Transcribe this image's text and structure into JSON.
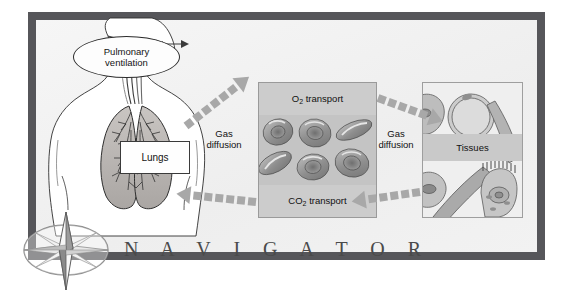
{
  "figure": {
    "title_word": "N A V I G A T O R",
    "frame_color": "#56565a",
    "background_color": "#f3f3f3"
  },
  "nodes": {
    "pulmonary_ventilation": "Pulmonary\nventilation",
    "pulmonary_ventilation_line1": "Pulmonary",
    "pulmonary_ventilation_line2": "ventilation",
    "lungs": "Lungs",
    "o2_transport_pre": "O",
    "o2_transport_sub": "2",
    "o2_transport_post": " transport",
    "co2_transport_pre": "CO",
    "co2_transport_sub": "2",
    "co2_transport_post": " transport",
    "tissues": "Tissues"
  },
  "labels": {
    "gas_diffusion_left_line1": "Gas",
    "gas_diffusion_left_line2": "diffusion",
    "gas_diffusion_right_line1": "Gas",
    "gas_diffusion_right_line2": "diffusion"
  },
  "arrows": [
    {
      "name": "lungs-to-blood-o2",
      "direction": "right",
      "style": "dashed-block"
    },
    {
      "name": "blood-to-lungs-co2",
      "direction": "left",
      "style": "dashed-block"
    },
    {
      "name": "blood-to-tissues-o2",
      "direction": "right",
      "style": "dashed-block"
    },
    {
      "name": "tissues-to-blood-co2",
      "direction": "left",
      "style": "dashed-block"
    }
  ],
  "icons": {
    "compass_rose": "compass-rose-icon",
    "torso": "human-torso-lungs-illustration",
    "red_blood_cells": "red-blood-cells-illustration",
    "tissue_cells": "tissue-cells-illustration"
  },
  "colors": {
    "frame": "#56565a",
    "panel_gray": "#cfcfcf",
    "cell_gray": "#9d9d9d",
    "text": "#141414",
    "navigator_text": "#4a4a4a"
  }
}
